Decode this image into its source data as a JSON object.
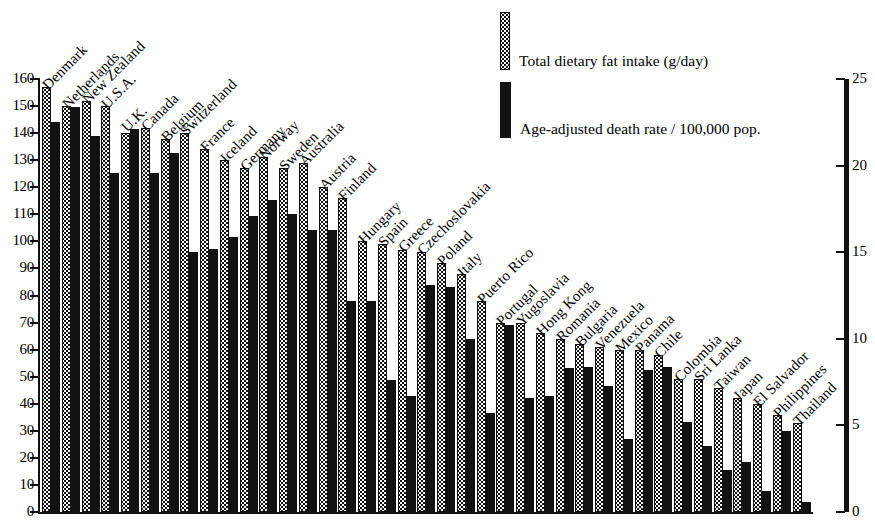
{
  "chart_data": {
    "type": "bar",
    "title": "",
    "subtitle": "",
    "xlabel": "",
    "ylabel": "",
    "y_left": {
      "label": "Total dietary fat intake (g/day)",
      "min": 0,
      "max": 160,
      "step": 10,
      "ticks": [
        0,
        10,
        20,
        30,
        40,
        50,
        60,
        70,
        80,
        90,
        100,
        110,
        120,
        130,
        140,
        150,
        160
      ]
    },
    "y_right": {
      "label": "Age-adjusted death rate / 100,000 pop.",
      "min": 0,
      "max": 25,
      "step": 5,
      "ticks": [
        0,
        5,
        10,
        15,
        20,
        25
      ]
    },
    "grid": false,
    "legend_position": "top-right",
    "legend": [
      {
        "key": "fat",
        "label": "Total dietary fat intake (g/day)",
        "pattern": "stippled",
        "color": "#ffffff"
      },
      {
        "key": "death",
        "label": "Age-adjusted death rate / 100,000 pop.",
        "pattern": "solid",
        "color": "#111111"
      }
    ],
    "categories": [
      "Denmark",
      "Netherlands",
      "New Zealand",
      "U.S.A.",
      "U.K.",
      "Canada",
      "Belgium",
      "Switzerland",
      "France",
      "Iceland",
      "Germany",
      "Norway",
      "Sweden",
      "Australia",
      "Austria",
      "Finland",
      "Hungary",
      "Spain",
      "Greece",
      "Czechoslovakia",
      "Poland",
      "Italy",
      "Puerto Rico",
      "Portugal",
      "Yugoslavia",
      "Hong Kong",
      "Romania",
      "Bulgaria",
      "Venezuela",
      "Mexico",
      "Panama",
      "Chile",
      "Colombia",
      "Sri Lanka",
      "Taiwan",
      "Japan",
      "El Salvador",
      "Philippines",
      "Thailand"
    ],
    "series": [
      {
        "name": "Total dietary fat intake (g/day)",
        "axis": "left",
        "units": "g/day",
        "values": [
          157,
          150,
          152,
          150,
          140,
          142,
          138,
          140,
          134,
          130,
          127,
          131,
          127,
          129,
          120,
          116,
          100,
          99,
          97,
          96,
          92,
          88,
          78,
          70,
          70,
          66,
          64,
          62,
          61,
          60,
          60,
          58,
          49,
          49,
          46,
          42,
          40,
          36,
          33
        ]
      },
      {
        "name": "Age-adjusted death rate / 100,000 pop.",
        "axis": "right",
        "units": "per 100,000",
        "values": [
          22.5,
          23.4,
          21.7,
          19.6,
          22.1,
          19.6,
          20.7,
          15.0,
          15.2,
          15.9,
          17.1,
          18.0,
          17.2,
          16.3,
          16.3,
          12.2,
          12.2,
          7.6,
          6.7,
          13.1,
          13.0,
          10.0,
          5.7,
          10.8,
          6.6,
          6.7,
          8.3,
          8.4,
          7.3,
          4.2,
          8.2,
          8.4,
          5.2,
          3.8,
          2.4,
          2.9,
          1.2,
          4.7,
          0.6
        ]
      }
    ]
  },
  "axes": {
    "left_ticks": [
      "0",
      "10",
      "20",
      "30",
      "40",
      "50",
      "60",
      "70",
      "80",
      "90",
      "100",
      "110",
      "120",
      "130",
      "140",
      "150",
      "160"
    ],
    "right_ticks": [
      "0",
      "5",
      "10",
      "15",
      "20",
      "25"
    ]
  }
}
